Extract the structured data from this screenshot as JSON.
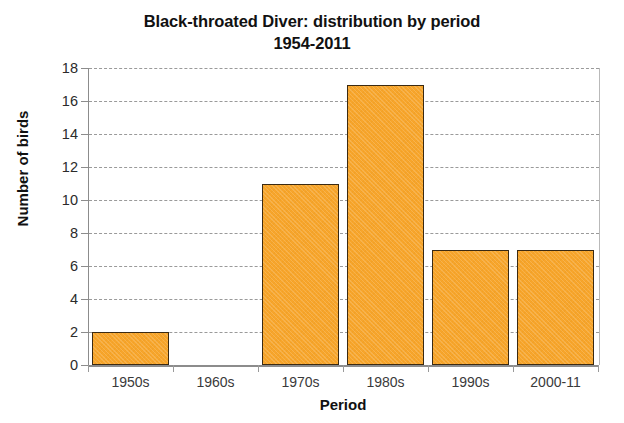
{
  "chart_data": {
    "type": "bar",
    "title": "Black-throated Diver: distribution by period",
    "subtitle": "1954-2011",
    "xlabel": "Period",
    "ylabel": "Number of birds",
    "categories": [
      "1950s",
      "1960s",
      "1970s",
      "1980s",
      "1990s",
      "2000-11"
    ],
    "values": [
      2,
      0,
      11,
      17,
      7,
      7
    ],
    "ylim": [
      0,
      18
    ],
    "ytick_step": 2,
    "yticks": [
      0,
      2,
      4,
      6,
      8,
      10,
      12,
      14,
      16,
      18
    ],
    "grid": true,
    "grid_axis": "y",
    "legend": false,
    "legend_position": "none",
    "series": [
      {
        "name": "Number of birds",
        "values": [
          2,
          0,
          11,
          17,
          7,
          7
        ]
      }
    ]
  },
  "style": {
    "bar_fill": "#f7a52b",
    "bar_border": "#3b2a12",
    "gridline_color": "#9a9a9a",
    "axis_color": "#8c8c8c",
    "text_color": "#111111",
    "tick_label_color": "#3a3a3a",
    "background": "#ffffff"
  }
}
